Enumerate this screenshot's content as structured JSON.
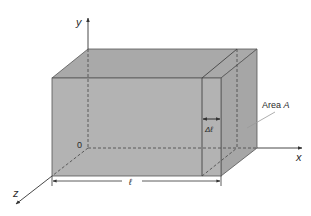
{
  "diagram": {
    "colors": {
      "face_front": "#b3b3b3",
      "face_top": "#a9a9a9",
      "face_side": "#a6a6a6",
      "edge": "#555555",
      "axis": "#333333"
    },
    "axes": {
      "x_label": "x",
      "y_label": "y",
      "z_label": "z",
      "origin_label": "0"
    },
    "annotations": {
      "length_label": "ℓ",
      "slice_label": "Δℓ",
      "area_label_prefix": "Area ",
      "area_label_var": "A"
    }
  }
}
